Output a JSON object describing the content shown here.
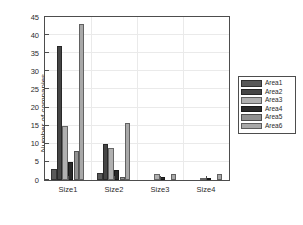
{
  "chart_data": {
    "type": "bar",
    "title": "",
    "xlabel": "",
    "ylabel": "Number of companies",
    "categories": [
      "Size1",
      "Size2",
      "Size3",
      "Size4"
    ],
    "ylim": [
      0,
      45
    ],
    "yticks": [
      0,
      5,
      10,
      15,
      20,
      25,
      30,
      35,
      40,
      45
    ],
    "ytick_labels": [
      "0",
      "5",
      "10",
      "15",
      "20",
      "25",
      "30",
      "35",
      "40",
      "45"
    ],
    "grid": true,
    "legend_position": "right-outside",
    "series": [
      {
        "name": "Area1",
        "color": "#595959",
        "values": [
          3,
          2,
          0,
          0
        ]
      },
      {
        "name": "Area2",
        "color": "#454545",
        "values": [
          37,
          10,
          0,
          0
        ]
      },
      {
        "name": "Area3",
        "color": "#b0b0b0",
        "values": [
          15,
          8.8,
          1.7,
          0.6
        ]
      },
      {
        "name": "Area4",
        "color": "#2a2a2a",
        "values": [
          5,
          2.8,
          0.7,
          0.6
        ]
      },
      {
        "name": "Area5",
        "color": "#909090",
        "values": [
          8,
          0.7,
          0,
          0
        ]
      },
      {
        "name": "Area6",
        "color": "#a8a8a8",
        "values": [
          43,
          15.8,
          1.7,
          1.6
        ]
      }
    ]
  },
  "legend": {
    "entries": [
      "Area1",
      "Area2",
      "Area3",
      "Area4",
      "Area5",
      "Area6"
    ]
  },
  "axes": {
    "y_title": "Number of companies"
  }
}
